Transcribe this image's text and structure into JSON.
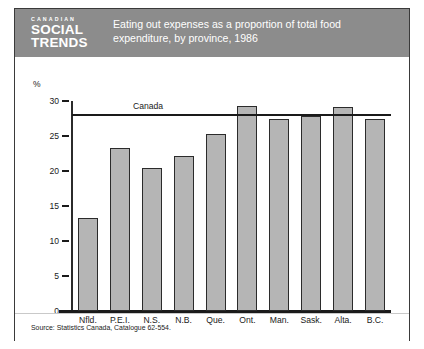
{
  "figure": {
    "logo": {
      "line1": "CANADIAN",
      "line2": "SOCIAL",
      "line3": "TRENDS"
    },
    "title": "Eating out expenses as a proportion of total food expenditure, by province, 1986",
    "source": "Source: Statistics Canada, Catalogue 62-554.",
    "colors": {
      "banner": "#8c8c8c",
      "bar_fill": "#b5b5b5",
      "bar_stroke": "#2b2b2b",
      "axis": "#1a1a1a",
      "border": "#3a3a3a",
      "background": "#ffffff"
    }
  },
  "chart_data": {
    "type": "bar",
    "title": "Eating out expenses as a proportion of total food expenditure, by province, 1986",
    "xlabel": "",
    "ylabel": "%",
    "categories": [
      "Nfld.",
      "P.E.I.",
      "N.S.",
      "N.B.",
      "Que.",
      "Ont.",
      "Man.",
      "Sask.",
      "Alta.",
      "B.C."
    ],
    "values": [
      13.3,
      23.3,
      20.4,
      22.1,
      25.3,
      29.3,
      27.4,
      27.8,
      29.2,
      27.4
    ],
    "ylim": [
      0,
      30
    ],
    "yticks": [
      0,
      5,
      10,
      15,
      20,
      25,
      30
    ],
    "ytick_labels": [
      "0",
      "5",
      "10",
      "15",
      "20",
      "25",
      "30"
    ],
    "grid": false,
    "legend": false,
    "reference_line": {
      "label": "Canada",
      "value": 28.0
    }
  }
}
